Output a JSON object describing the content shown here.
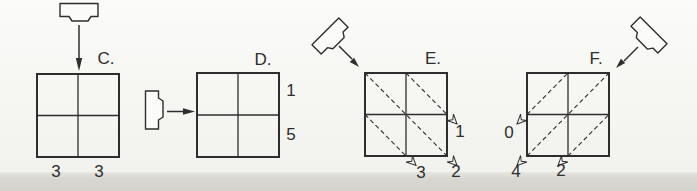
{
  "colors": {
    "ink": "#2e2e2e",
    "paper_top": "#fbfbf9",
    "paper_bottom": "#f2f2ee",
    "band": "#d7d6d1"
  },
  "panels": [
    {
      "label": "C.",
      "emitter_direction": "top",
      "values": [
        "3",
        "3"
      ]
    },
    {
      "label": "D.",
      "emitter_direction": "left",
      "values": [
        "1",
        "5"
      ]
    },
    {
      "label": "E.",
      "emitter_direction": "upper-left",
      "values": [
        "1",
        "2",
        "3"
      ]
    },
    {
      "label": "F.",
      "emitter_direction": "upper-right",
      "values": [
        "0",
        "4",
        "2"
      ]
    }
  ]
}
